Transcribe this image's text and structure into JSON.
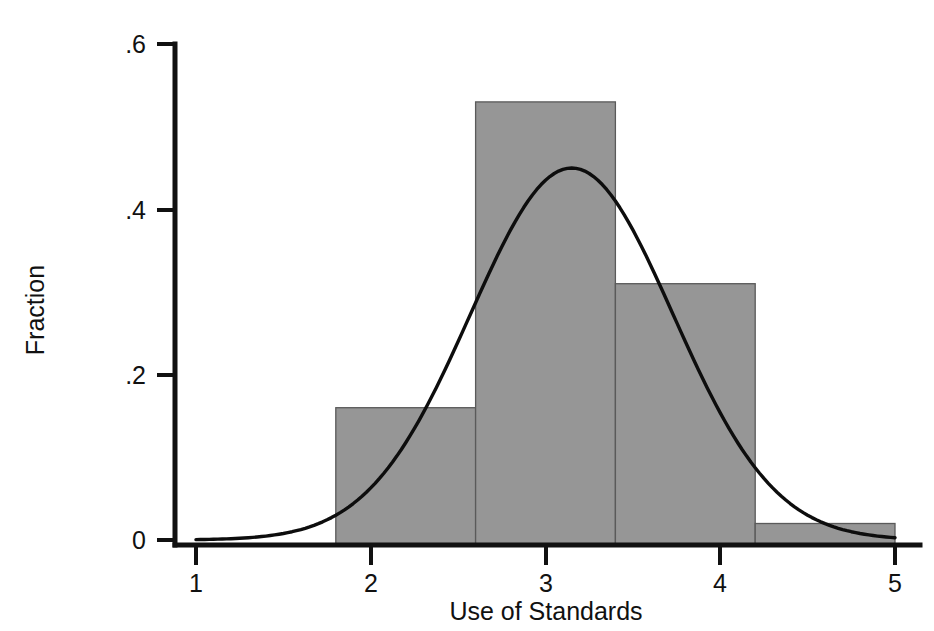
{
  "chart_data": {
    "type": "bar",
    "title": "",
    "subtitle": "",
    "xlabel": "Use of Standards",
    "ylabel": "Fraction",
    "xlim": [
      1,
      5
    ],
    "ylim": [
      0,
      0.6
    ],
    "grid": false,
    "legend": null,
    "x_ticks": [
      "1",
      "2",
      "3",
      "4",
      "5"
    ],
    "x_tick_values": [
      1,
      2,
      3,
      4,
      5
    ],
    "y_ticks": [
      "0",
      ".2",
      ".4",
      ".6"
    ],
    "y_tick_values": [
      0,
      0.2,
      0.4,
      0.6
    ],
    "categories": [
      "1.8-2.6",
      "2.6-3.4",
      "3.4-4.2",
      "4.2-5.0"
    ],
    "values": [
      0.16,
      0.53,
      0.31,
      0.02
    ],
    "bin_edges": [
      1.8,
      2.6,
      3.4,
      4.2,
      5.0
    ],
    "bar_fill_color": "#969696",
    "bar_edge_color": "#5a5a5a",
    "series": [
      {
        "name": "Fraction",
        "type": "bar",
        "values": [
          0.16,
          0.53,
          0.31,
          0.02
        ]
      },
      {
        "name": "Normal density overlay",
        "type": "line",
        "color": "#0d0d0d",
        "peak_x": 3.15,
        "peak_y": 0.45,
        "mean": 3.15,
        "sigma": 0.58,
        "amplitude": 0.45,
        "x_start": 1.0,
        "x_end": 5.0,
        "y_start": 0.01,
        "y_end": 0.02
      }
    ]
  },
  "caption": ""
}
